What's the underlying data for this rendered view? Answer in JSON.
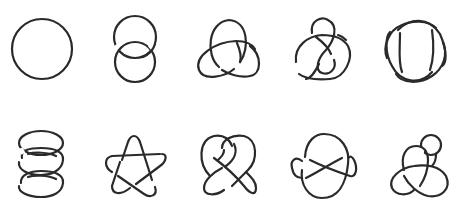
{
  "diagram": {
    "title": "Knot and link table",
    "stroke_color": "#2a2a2a",
    "background": "#ffffff",
    "rows": 2,
    "columns": 5
  },
  "knots": [
    {
      "id": "unknot",
      "label": "Unknot",
      "row": 0,
      "col": 0,
      "center": [
        42,
        49
      ]
    },
    {
      "id": "hopf-link",
      "label": "Hopf link",
      "row": 0,
      "col": 1,
      "center": [
        135,
        50
      ]
    },
    {
      "id": "trefoil",
      "label": "Trefoil knot",
      "row": 0,
      "col": 2,
      "center": [
        229,
        52
      ]
    },
    {
      "id": "figure-eight",
      "label": "Figure-eight knot",
      "row": 0,
      "col": 3,
      "center": [
        322,
        50
      ]
    },
    {
      "id": "four-crossing-link",
      "label": "Four-crossing link",
      "row": 0,
      "col": 4,
      "center": [
        415,
        50
      ]
    },
    {
      "id": "three-chain-link",
      "label": "Chain of three rings",
      "row": 1,
      "col": 0,
      "center": [
        41,
        163
      ]
    },
    {
      "id": "cinquefoil",
      "label": "Cinquefoil (star) knot",
      "row": 1,
      "col": 1,
      "center": [
        133,
        167
      ]
    },
    {
      "id": "heart-knot",
      "label": "Heart knot",
      "row": 1,
      "col": 2,
      "center": [
        230,
        166
      ]
    },
    {
      "id": "oval-knot",
      "label": "Oval twisted knot",
      "row": 1,
      "col": 3,
      "center": [
        323,
        167
      ]
    },
    {
      "id": "looped-trefoil",
      "label": "Trefoil with loop",
      "row": 1,
      "col": 4,
      "center": [
        418,
        167
      ]
    }
  ]
}
